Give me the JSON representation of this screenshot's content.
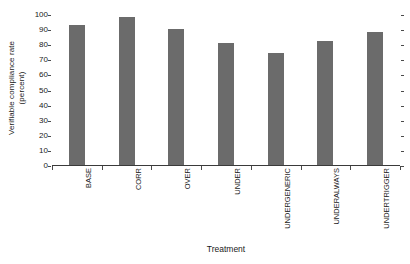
{
  "chart_data": {
    "type": "bar",
    "title": "",
    "subtitle": "",
    "categories": [
      "BASE",
      "CORR",
      "OVER",
      "UNDER",
      "UNDERGENERIC",
      "UNDERALWAYS",
      "UNDERTRIGGER"
    ],
    "values": [
      93,
      98,
      90,
      81,
      74,
      82,
      88
    ],
    "series": [
      {
        "name": "Verifiable compliance rate",
        "values": [
          93,
          98,
          90,
          81,
          74,
          82,
          88
        ]
      }
    ],
    "xlabel": "Treatment",
    "ylabel_line1": "Verifiable compliance rate",
    "ylabel_line2": "(percent)",
    "ylabel": "Verifiable compliance rate (percent)",
    "ylim": [
      0,
      100
    ],
    "yticks": [
      0,
      10,
      20,
      30,
      40,
      50,
      60,
      70,
      80,
      90,
      100
    ],
    "ytick_labels": [
      "0",
      "10",
      "20",
      "30",
      "40",
      "50",
      "60",
      "70",
      "80",
      "90",
      "100"
    ],
    "grid": false,
    "legend": null,
    "legend_position": "none",
    "bar_color": "#6b6b6b",
    "axis_color": "#3a3a3a",
    "background_color": "#ffffff",
    "annotations": []
  }
}
